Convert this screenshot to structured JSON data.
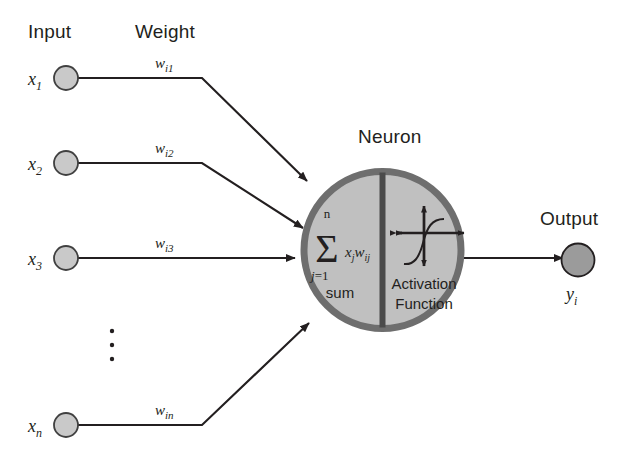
{
  "figure": {
    "background_color": "#ffffff",
    "stroke_color": "#231f20",
    "input_node_fill": "#c9c9c9",
    "output_node_fill": "#9b9b9b",
    "neuron_fill": "#c0c0c0",
    "neuron_border_color": "#6e6e6e"
  },
  "headers": {
    "input": "Input",
    "weight": "Weight",
    "neuron": "Neuron",
    "output": "Output"
  },
  "inputs": [
    {
      "label": "x",
      "sub": "1",
      "weight": "w",
      "weight_sub": "i1"
    },
    {
      "label": "x",
      "sub": "2",
      "weight": "w",
      "weight_sub": "i2"
    },
    {
      "label": "x",
      "sub": "3",
      "weight": "w",
      "weight_sub": "i3"
    },
    {
      "label": "x",
      "sub": "n",
      "weight": "w",
      "weight_sub": "in"
    }
  ],
  "ellipsis": "⋮",
  "neuron": {
    "sum_half": {
      "sigma": "Σ",
      "upper_limit": "n",
      "lower_limit_var": "j",
      "lower_limit_rest": "=1",
      "term": "x",
      "term_sub1": "j",
      "term2": "w",
      "term_sub2": "ij",
      "caption": "sum"
    },
    "activation_half": {
      "caption_line1": "Activation",
      "caption_line2": "Function",
      "curve_name": "sigmoid-curve"
    }
  },
  "output": {
    "label": "y",
    "sub": "i"
  }
}
